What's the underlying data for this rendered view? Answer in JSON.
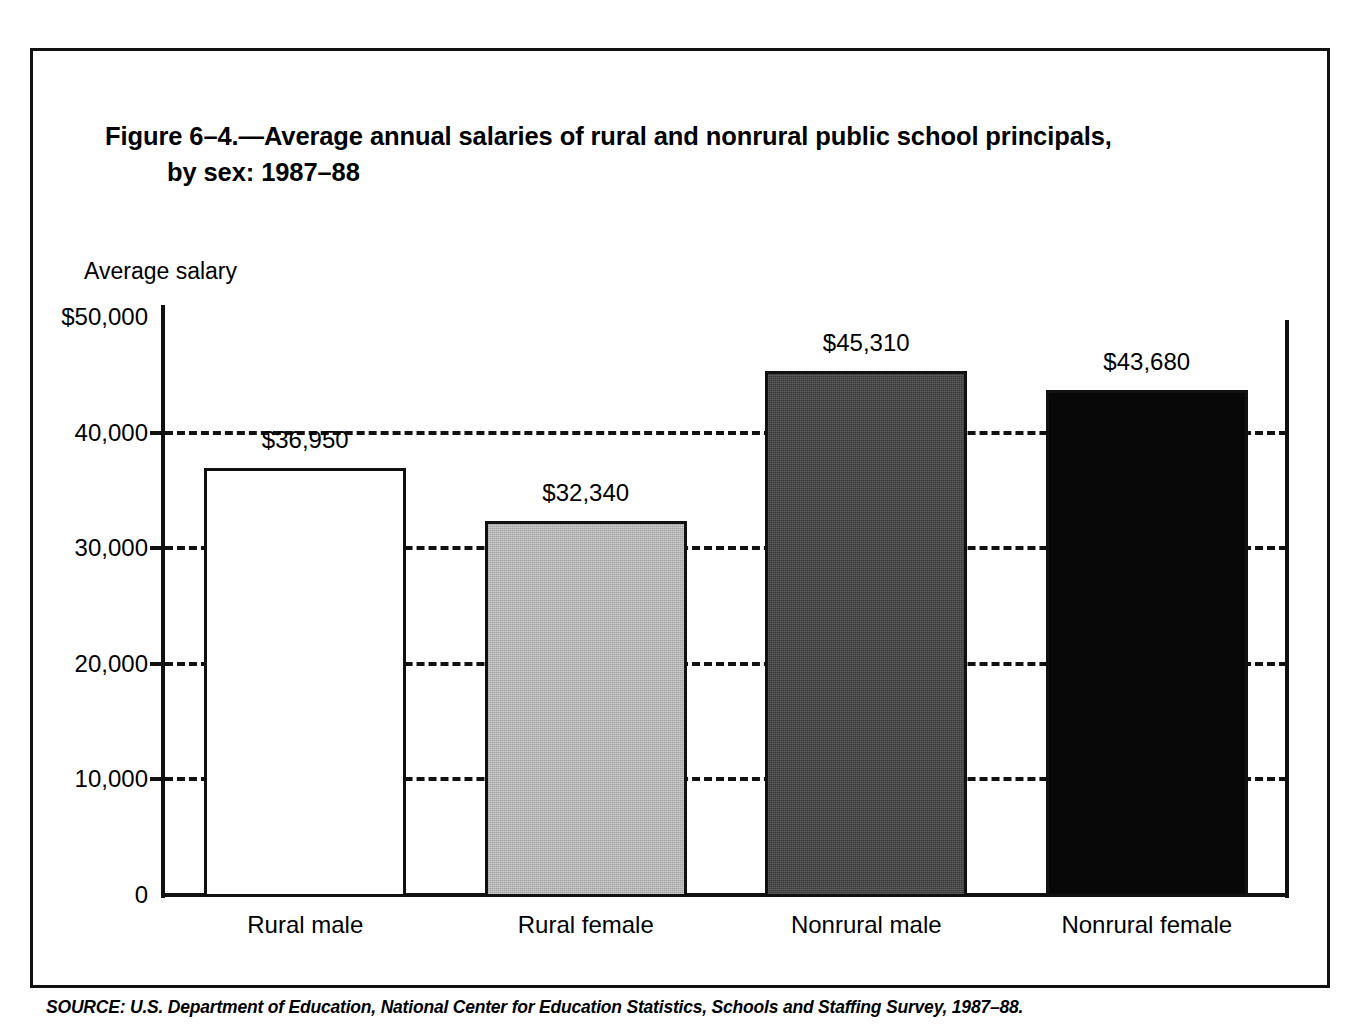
{
  "figure": {
    "title_line1": "Figure 6–4.—Average annual salaries of rural and nonrural public school principals,",
    "title_line2": "by sex: 1987–88",
    "axis_title": "Average salary",
    "source": "SOURCE: U.S. Department of Education, National Center for Education Statistics, Schools and Staffing Survey, 1987–88."
  },
  "chart_data": {
    "type": "bar",
    "title": "Figure 6–4.—Average annual salaries of rural and nonrural public school principals, by sex: 1987–88",
    "subtitle": "",
    "xlabel": "",
    "ylabel": "Average salary",
    "ylim": [
      0,
      50000
    ],
    "yticks": [
      0,
      10000,
      20000,
      30000,
      40000,
      50000
    ],
    "ytick_labels": [
      "0",
      "10,000",
      "20,000",
      "30,000",
      "40,000",
      "$50,000"
    ],
    "grid": "horizontal-dashed",
    "legend": "none",
    "categories": [
      "Rural male",
      "Rural female",
      "Nonrural male",
      "Nonrural female"
    ],
    "values": [
      36950,
      32340,
      45310,
      43680
    ],
    "value_labels": [
      "$36,950",
      "$32,340",
      "$45,310",
      "$43,680"
    ],
    "bar_fills": [
      "#ffffff",
      "#b4b4b4",
      "#3b3b3b",
      "#080808"
    ],
    "bar_fill_names": [
      "white",
      "light-gray",
      "dark-gray",
      "black"
    ],
    "bar_edge_color": "#111111"
  }
}
